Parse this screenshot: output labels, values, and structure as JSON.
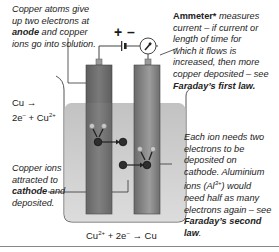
{
  "diagram": {
    "polarity": {
      "plus": "+",
      "minus": "–"
    },
    "labels": {
      "anode_note": {
        "line1": "Copper atoms give",
        "line2": "up two electrons at",
        "bold": "anode",
        "line3_rest": " and copper",
        "line4": "ions go into solution."
      },
      "ammeter_note": {
        "bold": "Ammeter*",
        "line1_rest": " measures",
        "line2": "current – if current or",
        "line3": "length of time for",
        "line4": "which it flows is",
        "line5": "increased, then more",
        "line6": "copper deposited – see",
        "law": "Faraday’s first law."
      },
      "anode_equation": {
        "line1": "Cu →",
        "line2_a": "2e",
        "line2_a_sup": "–",
        "line2_b": " + Cu",
        "line2_b_sup": "2+"
      },
      "cathode_note": {
        "line1": "Copper ions",
        "line2": "attracted to",
        "bold": "cathode",
        "line3_rest": " and",
        "line4": "deposited."
      },
      "second_law_note": {
        "line1": "Each ion needs two",
        "line2": "electrons to be",
        "line3": "deposited on",
        "line4": "cathode. Aluminium",
        "line5_a": "ions (Al",
        "line5_sup": "3+",
        "line5_b": ") would",
        "line6": "need half as many",
        "line7": "electrons again – see",
        "law1": "Faraday’s second",
        "law2": "law",
        "law2_end": "."
      },
      "cathode_equation": {
        "a": "Cu",
        "a_sup": "2+",
        "b": " + 2e",
        "b_sup": "–",
        "c": " → Cu"
      }
    },
    "colors": {
      "electrode_dark": "#6d6d6d",
      "electrode_light": "#9a9a9a",
      "solution": "#c9c9c9",
      "beaker_outline": "#555555",
      "wire": "#444444",
      "atom": "#333333",
      "electron": "#bdbdbd"
    }
  }
}
